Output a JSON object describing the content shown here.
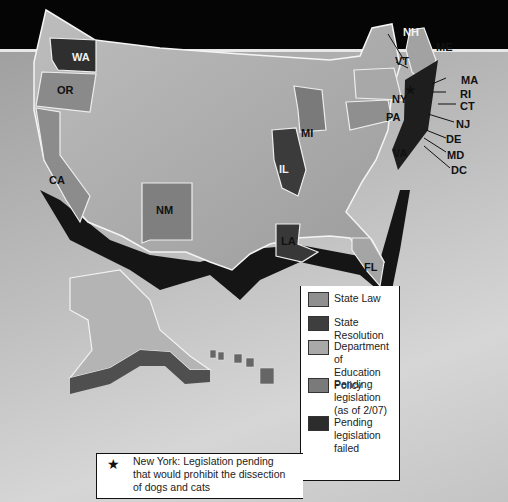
{
  "map": {
    "state_labels": [
      {
        "id": "WA",
        "text": "WA"
      },
      {
        "id": "OR",
        "text": "OR"
      },
      {
        "id": "CA",
        "text": "CA"
      },
      {
        "id": "NM",
        "text": "NM"
      },
      {
        "id": "IL",
        "text": "IL"
      },
      {
        "id": "MI",
        "text": "MI"
      },
      {
        "id": "LA",
        "text": "LA"
      },
      {
        "id": "FL",
        "text": "FL"
      },
      {
        "id": "PA",
        "text": "PA"
      },
      {
        "id": "NY",
        "text": "NY"
      },
      {
        "id": "VA",
        "text": "VA"
      },
      {
        "id": "NH",
        "text": "NH"
      },
      {
        "id": "VT",
        "text": "VT"
      },
      {
        "id": "ME",
        "text": "ME"
      },
      {
        "id": "MA",
        "text": "MA"
      },
      {
        "id": "RI",
        "text": "RI"
      },
      {
        "id": "CT",
        "text": "CT"
      },
      {
        "id": "NJ",
        "text": "NJ"
      },
      {
        "id": "DE",
        "text": "DE"
      },
      {
        "id": "MD",
        "text": "MD"
      },
      {
        "id": "DC",
        "text": "DC"
      }
    ],
    "ny_marker": "★"
  },
  "legend": {
    "items": [
      {
        "label_line1": "State Law",
        "label_line2": "",
        "color": "#8f8f8f"
      },
      {
        "label_line1": "State Resolution",
        "label_line2": "",
        "color": "#3e3e3e"
      },
      {
        "label_line1": "Department of",
        "label_line2": "Education Policy",
        "color": "#a9a9a9"
      },
      {
        "label_line1": "Pending legislation",
        "label_line2": "(as of 2/07)",
        "color": "#7a7a7a"
      },
      {
        "label_line1": "Pending legislation",
        "label_line2": "failed",
        "color": "#2c2c2c"
      }
    ]
  },
  "note": {
    "icon": "★",
    "line1": "New York: Legislation pending",
    "line2": "that would prohibit the dissection",
    "line3": "of dogs and cats"
  }
}
